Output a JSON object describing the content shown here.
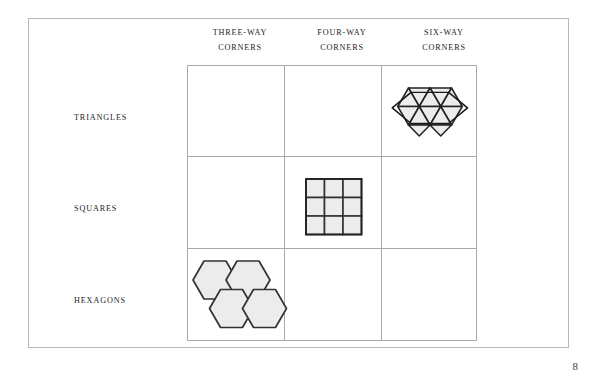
{
  "page": {
    "number": "8",
    "background_color": "#ffffff",
    "frame_color": "#b8b8b8"
  },
  "matrix": {
    "column_headers": [
      {
        "line1": "THREE-WAY",
        "line2": "CORNERS",
        "key": "three-way"
      },
      {
        "line1": "FOUR-WAY",
        "line2": "CORNERS",
        "key": "four-way"
      },
      {
        "line1": "SIX-WAY",
        "line2": "CORNERS",
        "key": "six-way"
      }
    ],
    "row_labels": [
      {
        "label": "TRIANGLES",
        "key": "triangles"
      },
      {
        "label": "SQUARES",
        "key": "squares"
      },
      {
        "label": "HEXAGONS",
        "key": "hexagons"
      }
    ],
    "grid_line_color": "#a9a9a9",
    "cells": [
      {
        "row": "triangles",
        "column": "three-way",
        "figure": "none"
      },
      {
        "row": "triangles",
        "column": "four-way",
        "figure": "none"
      },
      {
        "row": "triangles",
        "column": "six-way",
        "figure": "triangle-tiling"
      },
      {
        "row": "squares",
        "column": "three-way",
        "figure": "none"
      },
      {
        "row": "squares",
        "column": "four-way",
        "figure": "square-tiling"
      },
      {
        "row": "squares",
        "column": "six-way",
        "figure": "none"
      },
      {
        "row": "hexagons",
        "column": "three-way",
        "figure": "hexagon-tiling"
      },
      {
        "row": "hexagons",
        "column": "four-way",
        "figure": "none"
      },
      {
        "row": "hexagons",
        "column": "six-way",
        "figure": "none"
      }
    ]
  },
  "figures": {
    "triangle_tiling": {
      "name": "triangle-tiling",
      "description": "Hexagonal cluster of 12 equilateral triangles",
      "triangle_count": 12,
      "fill_color": "#ececec",
      "stroke_color": "#222222"
    },
    "square_tiling": {
      "name": "square-tiling",
      "description": "Three by three grid of squares",
      "rows": 3,
      "columns": 3,
      "square_count": 9,
      "fill_color": "#ececec",
      "stroke_color": "#333333"
    },
    "hexagon_tiling": {
      "name": "hexagon-tiling",
      "description": "Four regular hexagons in honeycomb arrangement",
      "hexagon_count": 4,
      "fill_color": "#ececec",
      "stroke_color": "#333333"
    }
  }
}
